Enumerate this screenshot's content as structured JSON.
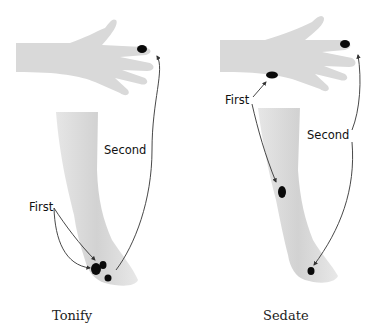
{
  "panels": [
    {
      "caption": "Tonify",
      "labels": {
        "first": "First",
        "second": "Second"
      }
    },
    {
      "caption": "Sedate",
      "labels": {
        "first": "First",
        "second": "Second"
      }
    }
  ],
  "colors": {
    "skin": "#dcdcdc",
    "skin_shadow": "#c4c4c4",
    "point": "#0a0a0a",
    "arrow": "#333333"
  }
}
